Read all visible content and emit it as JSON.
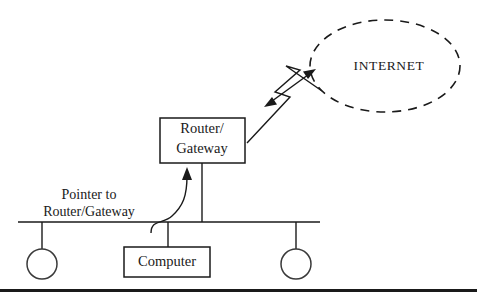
{
  "diagram": {
    "background_color": "#ffffff",
    "line_color": "#1a1a1a",
    "nodes": {
      "internet_cloud": {
        "label": "INTERNET",
        "shape": "dashed-ellipse",
        "center": [
          385,
          66
        ],
        "radius_x": 75,
        "radius_y": 46
      },
      "router_box": {
        "label_line_1": "Router/",
        "label_line_2": "Gateway",
        "shape": "rectangle",
        "x": 160,
        "y": 118,
        "width": 85,
        "height": 45
      },
      "computer_box": {
        "label": "Computer",
        "shape": "rectangle",
        "x": 124,
        "y": 247,
        "width": 86,
        "height": 30
      },
      "terminal_left": {
        "label": "",
        "shape": "circle",
        "center": [
          42,
          264
        ],
        "radius": 15
      },
      "terminal_right": {
        "label": "",
        "shape": "circle",
        "center": [
          296,
          264
        ],
        "radius": 15
      }
    },
    "annotations": {
      "pointer_note_line_1": "Pointer to",
      "pointer_note_line_2": "Router/Gateway"
    },
    "connectors": {
      "wan_link": {
        "style": "lightning-bolt",
        "from": "router_box",
        "to": "internet_cloud",
        "arrow": "double-headed"
      },
      "router_to_bus": {
        "style": "straight-vertical",
        "from": "router_box",
        "to": "network_bus"
      },
      "computer_to_bus": {
        "style": "straight-vertical",
        "from": "computer_box",
        "to": "network_bus"
      },
      "pointer_arrow": {
        "style": "curved",
        "arrow": "single-headed",
        "points_to": "router_to_bus"
      }
    },
    "network_bus": {
      "style": "horizontal-line",
      "y": 222,
      "x_start": 18,
      "x_end": 320
    },
    "bottom_rule": {
      "y": 289,
      "height": 3,
      "x_start": 0,
      "x_end": 477
    }
  }
}
